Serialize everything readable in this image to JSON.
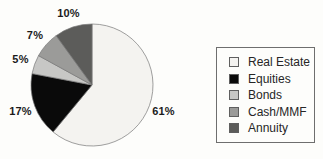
{
  "chart_data": {
    "type": "pie",
    "title": "",
    "slices": [
      {
        "label": "Real Estate",
        "value": 61,
        "display": "61%",
        "color": "#f4f3f0"
      },
      {
        "label": "Equities",
        "value": 17,
        "display": "17%",
        "color": "#0a0a0a"
      },
      {
        "label": "Bonds",
        "value": 5,
        "display": "5%",
        "color": "#c7c7c5"
      },
      {
        "label": "Cash/MMF",
        "value": 7,
        "display": "7%",
        "color": "#9b9b99"
      },
      {
        "label": "Annuity",
        "value": 10,
        "display": "10%",
        "color": "#5c5c5a"
      }
    ],
    "start_angle_deg": 0,
    "direction": "clockwise",
    "slice_labels_position": "outside",
    "legend_position": "right",
    "legend_border": true
  },
  "colors": {
    "background": "#fdfdfb",
    "slice_stroke": "#777777",
    "legend_border": "#6e6e6e",
    "label_text": "#1b1b1b",
    "legend_text": "#262626"
  }
}
